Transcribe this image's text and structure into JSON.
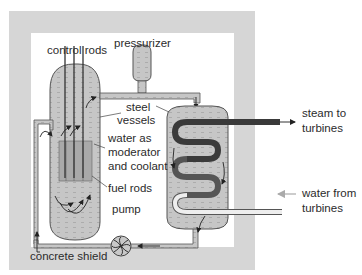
{
  "diagram": {
    "type": "pressurized water reactor schematic",
    "labels": {
      "control_rods": "control rods",
      "pressurizer": "pressurizer",
      "steel_vessels_1": "steel",
      "steel_vessels_2": "vessels",
      "water_1": "water as",
      "water_2": "moderator",
      "water_3": "and coolant",
      "fuel_rods": "fuel rods",
      "pump": "pump",
      "concrete_shield": "concrete shield",
      "steam_1": "steam to",
      "steam_2": "turbines",
      "water_from_1": "water from",
      "water_from_2": "turbines"
    },
    "colors": {
      "shield": "#d6d6d6",
      "vessel_fill": "#c4c4c4",
      "outline": "#555555",
      "hot_pipe": "#3a3a3a",
      "cold_pipe": "#eeeeee",
      "text": "#2b2b2b"
    }
  }
}
